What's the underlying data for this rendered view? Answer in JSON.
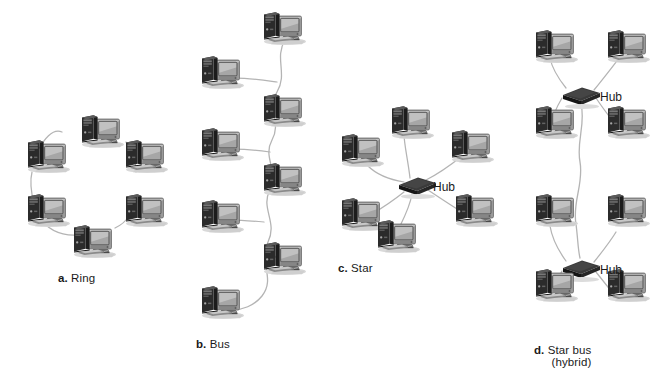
{
  "figure": {
    "background_color": "#ffffff",
    "ink_color": "#1a1a1a",
    "link_color": "#b4b4b4"
  },
  "captions": [
    {
      "letter": "a.",
      "name": "Ring",
      "line2": "",
      "x": 58,
      "y": 272
    },
    {
      "letter": "b.",
      "name": "Bus",
      "line2": "",
      "x": 196,
      "y": 338
    },
    {
      "letter": "c.",
      "name": "Star",
      "line2": "",
      "x": 338,
      "y": 262
    },
    {
      "letter": "d.",
      "name": "Star bus",
      "line2": "(hybrid)",
      "x": 534,
      "y": 344
    }
  ],
  "hub_labels": [
    {
      "text": "Hub",
      "x": 433,
      "y": 180
    },
    {
      "text": "Hub",
      "x": 600,
      "y": 90
    },
    {
      "text": "Hub",
      "x": 600,
      "y": 263
    }
  ],
  "topologies": [
    {
      "id": "ring",
      "label": "a. Ring",
      "node_count": 6,
      "hub_count": 0,
      "computers": [
        {
          "x": 76,
          "y": 113
        },
        {
          "x": 22,
          "y": 138
        },
        {
          "x": 22,
          "y": 192
        },
        {
          "x": 68,
          "y": 223
        },
        {
          "x": 120,
          "y": 192
        },
        {
          "x": 120,
          "y": 138
        }
      ]
    },
    {
      "id": "bus",
      "label": "b. Bus",
      "node_count": 8,
      "hub_count": 0,
      "computers": [
        {
          "x": 258,
          "y": 10
        },
        {
          "x": 196,
          "y": 54
        },
        {
          "x": 258,
          "y": 92
        },
        {
          "x": 196,
          "y": 126
        },
        {
          "x": 258,
          "y": 161
        },
        {
          "x": 196,
          "y": 198
        },
        {
          "x": 258,
          "y": 240
        },
        {
          "x": 196,
          "y": 284
        }
      ]
    },
    {
      "id": "star",
      "label": "c. Star",
      "node_count": 6,
      "hub_count": 1,
      "hub": {
        "x": 396,
        "y": 176
      },
      "computers": [
        {
          "x": 386,
          "y": 104
        },
        {
          "x": 336,
          "y": 132
        },
        {
          "x": 446,
          "y": 128
        },
        {
          "x": 336,
          "y": 196
        },
        {
          "x": 372,
          "y": 218
        },
        {
          "x": 450,
          "y": 192
        }
      ]
    },
    {
      "id": "star-bus",
      "label": "d. Star bus (hybrid)",
      "node_count": 8,
      "hub_count": 2,
      "hubs": [
        {
          "x": 560,
          "y": 86
        },
        {
          "x": 560,
          "y": 259
        }
      ],
      "computers": [
        {
          "x": 530,
          "y": 28
        },
        {
          "x": 602,
          "y": 28
        },
        {
          "x": 530,
          "y": 104
        },
        {
          "x": 602,
          "y": 104
        },
        {
          "x": 530,
          "y": 192
        },
        {
          "x": 602,
          "y": 192
        },
        {
          "x": 530,
          "y": 267
        },
        {
          "x": 602,
          "y": 267
        }
      ]
    }
  ]
}
